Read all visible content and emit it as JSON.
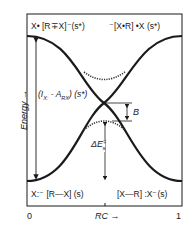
{
  "diagram": {
    "top_left_label": "X•  [R∓X]⁻(s*)",
    "top_left_parts": {
      "species": "X•",
      "complex": "[R•X]⁻",
      "state": "(s*)"
    },
    "top_right_label": "⁻[X•R]  •X (s*)",
    "top_right_parts": {
      "complex": "⁻[X•R]",
      "species": "•X",
      "state": "(s*)"
    },
    "bottom_left_label": "X:⁻  [R—X] (s)",
    "bottom_left_parts": {
      "species": "X:⁻",
      "complex": "[R—X]",
      "state": "(s)"
    },
    "bottom_right_label": "[X—R]  :X⁻(s)",
    "bottom_right_parts": {
      "complex": "[X—R]",
      "species": ":X⁻",
      "state": "(s)"
    },
    "gap_label": "(I",
    "gap_sub1": "X:",
    "gap_mid": " - A",
    "gap_sub2": "RX",
    "gap_end": ") (s*)",
    "b_label": "B",
    "barrier_label": "ΔE",
    "barrier_sup": "‡",
    "barrier_sub": "s",
    "y_axis_label": "Energy →",
    "x_axis_label": "RC →",
    "x_tick_0": "0",
    "x_tick_1": "1"
  }
}
